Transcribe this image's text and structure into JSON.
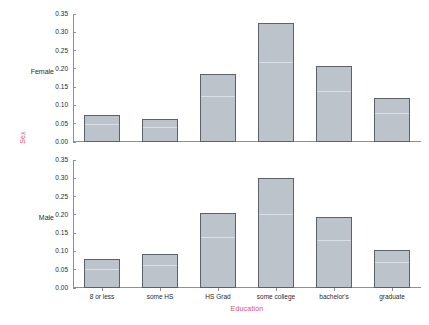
{
  "chart_data": {
    "type": "bar",
    "title": "",
    "xlabel": "Education",
    "ylabel": "Sex",
    "categories": [
      "8 or less",
      "some HS",
      "HS Grad",
      "some college",
      "bachelor's",
      "graduate"
    ],
    "ylim": [
      0.0,
      0.35
    ],
    "yticks": [
      0.0,
      0.05,
      0.1,
      0.15,
      0.2,
      0.25,
      0.3,
      0.35
    ],
    "ytick_labels": [
      "0.00",
      "0.05",
      "0.10",
      "0.15",
      "0.20",
      "0.25",
      "0.30",
      "0.35"
    ],
    "grid": false,
    "legend": "none",
    "panel_layout": "stacked-rows",
    "series": [
      {
        "name": "Female",
        "panel_label": "Female",
        "values": [
          0.075,
          0.063,
          0.185,
          0.325,
          0.208,
          0.12
        ]
      },
      {
        "name": "Male",
        "panel_label": "Male",
        "values": [
          0.078,
          0.092,
          0.205,
          0.3,
          0.195,
          0.105
        ]
      }
    ],
    "colors": {
      "bar_fill": "#bdc3ca",
      "bar_border": "#59616b",
      "axis": "#8f8f8f",
      "axis_label": "#d4506a",
      "tick_text": "#2b2b2b",
      "background": "#ffffff"
    }
  }
}
